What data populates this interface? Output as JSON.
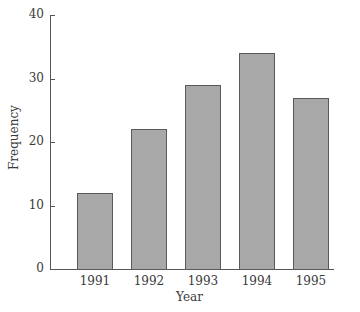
{
  "chart_data": {
    "type": "bar",
    "title": "",
    "xlabel": "Year",
    "ylabel": "Frequency",
    "categories": [
      "1991",
      "1992",
      "1993",
      "1994",
      "1995"
    ],
    "values": [
      12,
      22,
      29,
      34,
      27
    ],
    "ylim": [
      0,
      40
    ],
    "yticks": [
      "0",
      "10",
      "20",
      "30",
      "40"
    ],
    "grid": false,
    "legend": null,
    "colors": {
      "bar_fill": "#a8a8a8",
      "bar_edge": "#5a5a5a",
      "axis": "#555555"
    }
  }
}
